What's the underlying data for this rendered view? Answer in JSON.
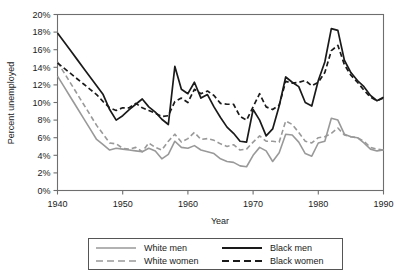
{
  "chart_data": {
    "type": "line",
    "title": "",
    "xlabel": "Year",
    "ylabel": "Percent unemployed",
    "xlim": [
      1940,
      1990
    ],
    "ylim": [
      0,
      20
    ],
    "grid": false,
    "legend_position": "bottom",
    "ytick_labels": [
      "0%",
      "2%",
      "4%",
      "6%",
      "8%",
      "10%",
      "12%",
      "14%",
      "16%",
      "18%",
      "20%"
    ],
    "ytick_values": [
      0,
      2,
      4,
      6,
      8,
      10,
      12,
      14,
      16,
      18,
      20
    ],
    "xtick_labels": [
      "1940",
      "1950",
      "1960",
      "1970",
      "1980",
      "1990"
    ],
    "xtick_values": [
      1940,
      1950,
      1960,
      1970,
      1980,
      1990
    ],
    "x": [
      1940,
      1941,
      1942,
      1943,
      1944,
      1945,
      1946,
      1947,
      1948,
      1949,
      1950,
      1951,
      1952,
      1953,
      1954,
      1955,
      1956,
      1957,
      1958,
      1959,
      1960,
      1961,
      1962,
      1963,
      1964,
      1965,
      1966,
      1967,
      1968,
      1969,
      1970,
      1971,
      1972,
      1973,
      1974,
      1975,
      1976,
      1977,
      1978,
      1979,
      1980,
      1981,
      1982,
      1983,
      1984,
      1985,
      1986,
      1987,
      1988,
      1989,
      1990
    ],
    "series": [
      {
        "name": "White men",
        "color": "#999999",
        "style": "solid",
        "values": [
          13.0,
          11.8,
          10.6,
          9.4,
          8.2,
          7.0,
          5.8,
          5.2,
          4.6,
          4.8,
          4.7,
          4.6,
          4.5,
          4.4,
          4.8,
          4.5,
          3.6,
          4.1,
          5.6,
          4.9,
          4.8,
          5.1,
          4.6,
          4.4,
          4.2,
          3.6,
          3.3,
          3.2,
          2.8,
          2.7,
          4.0,
          4.9,
          4.5,
          3.3,
          4.3,
          6.4,
          6.3,
          5.5,
          4.2,
          3.9,
          5.4,
          5.6,
          8.2,
          8.0,
          6.4,
          6.1,
          6.0,
          5.4,
          4.7,
          4.5,
          4.6
        ]
      },
      {
        "name": "White women",
        "color": "#999999",
        "style": "dashed",
        "values": [
          14.6,
          13.4,
          12.2,
          11.0,
          9.8,
          8.6,
          7.4,
          6.4,
          5.4,
          5.3,
          4.8,
          4.7,
          4.9,
          4.4,
          5.4,
          4.9,
          4.6,
          5.6,
          6.4,
          5.5,
          5.9,
          6.6,
          5.8,
          5.9,
          5.7,
          5.3,
          5.0,
          5.2,
          4.6,
          4.7,
          5.5,
          6.2,
          5.6,
          5.6,
          5.5,
          7.9,
          7.5,
          6.6,
          5.6,
          5.4,
          6.0,
          6.1,
          6.5,
          7.1,
          6.3,
          6.1,
          6.0,
          5.6,
          4.9,
          4.7,
          4.6
        ]
      },
      {
        "name": "Black men",
        "color": "#1a1a1a",
        "style": "solid",
        "values": [
          17.9,
          16.9,
          15.9,
          14.9,
          13.9,
          12.9,
          11.9,
          10.9,
          9.2,
          8.0,
          8.5,
          9.2,
          9.8,
          10.4,
          9.5,
          8.9,
          8.1,
          7.5,
          14.1,
          11.5,
          11.0,
          12.3,
          10.5,
          10.9,
          9.5,
          8.3,
          7.2,
          6.5,
          5.6,
          5.5,
          9.2,
          8.0,
          6.2,
          7.0,
          9.6,
          12.9,
          12.3,
          11.8,
          10.0,
          9.6,
          12.5,
          14.6,
          18.4,
          18.2,
          14.8,
          13.4,
          12.5,
          11.8,
          10.8,
          10.2,
          10.6
        ]
      },
      {
        "name": "Black women",
        "color": "#1a1a1a",
        "style": "dashed",
        "values": [
          14.5,
          13.9,
          13.3,
          12.7,
          12.1,
          11.5,
          10.9,
          10.1,
          9.4,
          9.1,
          9.4,
          9.4,
          9.9,
          9.4,
          9.1,
          8.8,
          8.4,
          8.5,
          10.1,
          10.5,
          10.0,
          11.5,
          11.0,
          11.3,
          10.8,
          9.9,
          9.8,
          9.8,
          8.4,
          8.0,
          9.5,
          11.0,
          9.5,
          9.2,
          9.7,
          12.4,
          12.2,
          12.3,
          12.5,
          11.9,
          12.3,
          13.4,
          15.9,
          16.5,
          14.3,
          13.1,
          12.3,
          11.4,
          10.6,
          10.2,
          10.5
        ]
      }
    ],
    "legend_entries": [
      {
        "label": "White men",
        "color": "#999999",
        "style": "solid"
      },
      {
        "label": "White women",
        "color": "#999999",
        "style": "dashed"
      },
      {
        "label": "Black men",
        "color": "#1a1a1a",
        "style": "solid"
      },
      {
        "label": "Black women",
        "color": "#1a1a1a",
        "style": "dashed"
      }
    ]
  }
}
